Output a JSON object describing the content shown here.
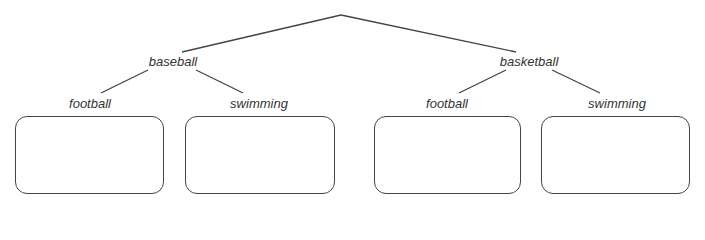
{
  "tree": {
    "level1": [
      {
        "label": "baseball",
        "children": [
          {
            "label": "football"
          },
          {
            "label": "swimming"
          }
        ]
      },
      {
        "label": "basketball",
        "children": [
          {
            "label": "football"
          },
          {
            "label": "swimming"
          }
        ]
      }
    ]
  },
  "colors": {
    "line": "#444444",
    "text": "#333333"
  }
}
